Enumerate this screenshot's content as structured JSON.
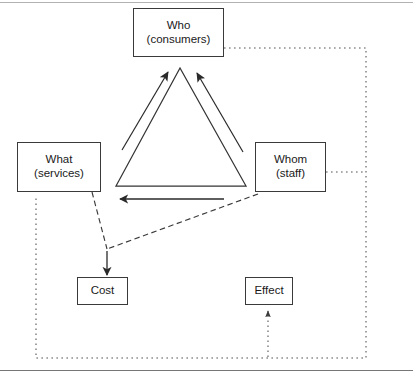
{
  "figure": {
    "background_color": "#ffffff",
    "line_color": "#333333",
    "box_border_color": "#3a3a3a",
    "dotted_color": "#555555"
  },
  "nodes": {
    "who": {
      "line1": "Who",
      "line2": "(consumers)"
    },
    "what": {
      "line1": "What",
      "line2": "(services)"
    },
    "whom": {
      "line1": "Whom",
      "line2": "(staff)"
    },
    "cost": {
      "line1": "Cost",
      "line2": ""
    },
    "effect": {
      "line1": "Effect",
      "line2": ""
    }
  },
  "connectors": {
    "what_to_who": {
      "style": "solid",
      "arrow": "up-right",
      "label": ""
    },
    "whom_to_who": {
      "style": "solid",
      "arrow": "up-left",
      "label": ""
    },
    "whom_to_what": {
      "style": "solid",
      "arrow": "left",
      "label": ""
    },
    "what_to_cost": {
      "style": "dashed",
      "arrow": "none",
      "label": ""
    },
    "whom_to_cost": {
      "style": "dashed",
      "arrow": "none",
      "label": ""
    },
    "junction_to_cost": {
      "style": "solid",
      "arrow": "down",
      "label": ""
    },
    "who_feedback_loop": {
      "style": "dotted",
      "arrow": "none",
      "label": ""
    },
    "whom_feedback_tap": {
      "style": "dotted",
      "arrow": "none",
      "label": ""
    },
    "what_feedback_tap": {
      "style": "dotted",
      "arrow": "none",
      "label": ""
    },
    "loop_to_effect": {
      "style": "dotted",
      "arrow": "up",
      "label": ""
    }
  },
  "shapes": {
    "triangle": {
      "apex_x": 180,
      "apex_y": 68,
      "base_left_x": 116,
      "base_right_x": 246,
      "base_y": 186
    }
  }
}
